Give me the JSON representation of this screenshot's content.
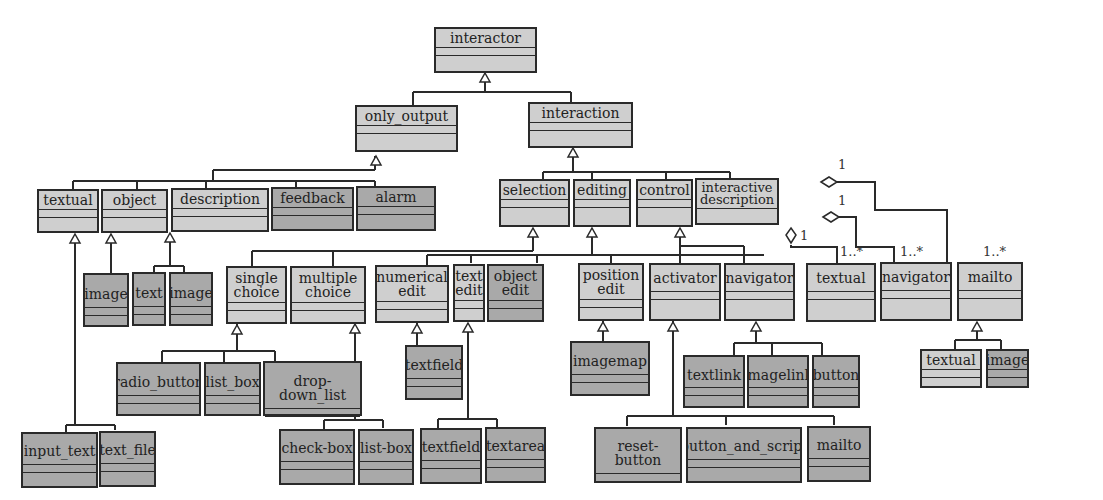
{
  "diagram": {
    "type": "UML class hierarchy",
    "colors": {
      "light_class": "#cfcfcf",
      "dark_class": "#a9a9a9",
      "line": "#2a2a2a"
    },
    "classes": {
      "interactor": "interactor",
      "only_output": "only_output",
      "interaction": "interaction",
      "oo_textual": "textual",
      "oo_object": "object",
      "oo_description": "description",
      "oo_feedback": "feedback",
      "oo_alarm": "alarm",
      "obj_image": "image",
      "desc_text": "text",
      "desc_image": "image",
      "input_text": "input_text",
      "text_file": "text_file",
      "selection": "selection",
      "editing": "editing",
      "control": "control",
      "interactive_description": "interactive\ndescription",
      "single_choice": "single\nchoice",
      "multiple_choice": "multiple\nchoice",
      "radio_button": "radio_button",
      "list_box": "list_box",
      "drop_down_list": "drop-down_list",
      "check_box": "check-box",
      "list_box2": "list-box",
      "numerical_edit": "numerical\nedit",
      "text_edit": "text\nedit",
      "object_edit": "object\nedit",
      "position_edit": "position\nedit",
      "ne_textfield": "textfield",
      "te_textfield": "textfield",
      "te_textarea": "textarea",
      "imagemap": "imagemap",
      "activator": "activator",
      "navigator": "navigator",
      "reset_button": "reset-button",
      "button_and_script": "button_and_script",
      "act_mailto": "mailto",
      "textlink": "textlink",
      "imagelink": "imagelink",
      "nav_button": "button",
      "id_textual": "textual",
      "id_navigator": "navigator",
      "id_mailto": "mailto",
      "mailto_textual": "textual",
      "mailto_image": "image"
    },
    "multiplicities": {
      "agg_top_one": "1",
      "agg_mid_one": "1",
      "agg_bottom_one": "1",
      "textual_many": "1..*",
      "navigator_many": "1..*",
      "mailto_many": "1..*"
    }
  }
}
